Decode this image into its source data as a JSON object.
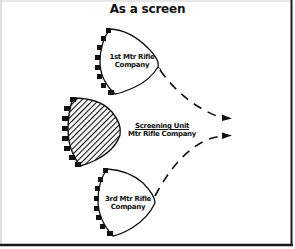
{
  "title": "As a screen",
  "units": [
    {
      "id": "first",
      "line1": "1st Mtr Rifle",
      "line2": "Company",
      "style": "outline"
    },
    {
      "id": "screen",
      "line1": "Screening Unit",
      "line2": "Mtr Rifle Company",
      "style": "hatched"
    },
    {
      "id": "third",
      "line1": "3rd Mtr Rifle",
      "line2": "Company",
      "style": "outline"
    }
  ],
  "arrows": [
    {
      "from": "1st Mtr Rifle Company",
      "direction": "right",
      "style": "dashed"
    },
    {
      "from": "3rd Mtr Rifle Company",
      "direction": "right",
      "style": "dashed"
    }
  ],
  "colors": {
    "ink": "#111111",
    "background": "#ffffff",
    "frame": "#1a1a1a"
  }
}
